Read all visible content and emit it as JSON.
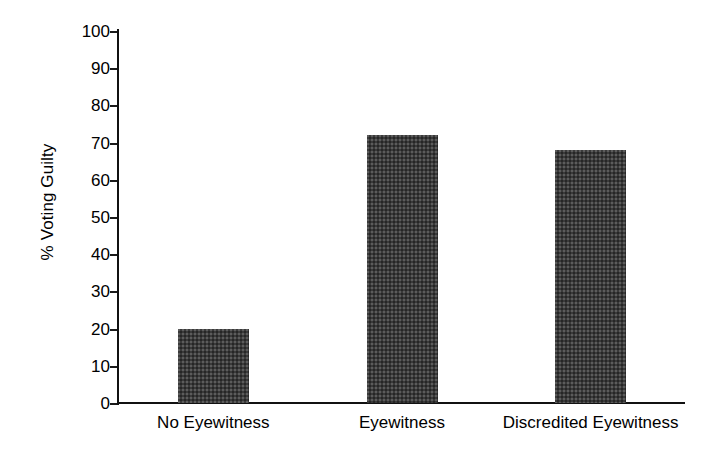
{
  "chart_data": {
    "type": "bar",
    "title": "",
    "subtitle": "",
    "xlabel": "",
    "ylabel": "% Voting Guilty",
    "categories": [
      "No Eyewitness",
      "Eyewitness",
      "Discredited Eyewitness"
    ],
    "values": [
      20,
      72,
      68
    ],
    "series": [
      {
        "name": "% Voting Guilty",
        "values": [
          20,
          72,
          68
        ]
      }
    ],
    "ylim": [
      0,
      100
    ],
    "y_ticks": [
      0,
      10,
      20,
      30,
      40,
      50,
      60,
      70,
      80,
      90,
      100
    ],
    "y_tick_labels": [
      "0",
      "10",
      "20",
      "30",
      "40",
      "50",
      "60",
      "70",
      "80",
      "90",
      "100"
    ],
    "grid": false,
    "legend": null,
    "legend_position": "none",
    "annotations": [],
    "bar_color": "#3a3a3a",
    "axis_color": "#111111",
    "background_color": "#ffffff"
  }
}
